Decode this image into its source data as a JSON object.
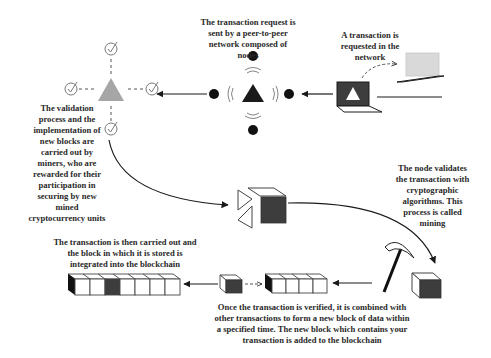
{
  "diagram": {
    "colors": {
      "background": "#ffffff",
      "ink": "#1a1a1a",
      "dark_fill": "#3d3d3d",
      "validation_gray": "#a6a6a6",
      "laptop_light": "#d9d9d9",
      "check_stroke": "#7a7a7a",
      "text": "#2a2a2a"
    },
    "steps": [
      {
        "id": "request",
        "order": 1,
        "text": "A transaction is\nrequested in the\nnetwork",
        "icon": "laptop-icon"
      },
      {
        "id": "broadcast",
        "order": 2,
        "text": "The transaction request is\nsent by a peer-to-peer\nnetwork composed of\nnodes",
        "icon": "broadcast-node-icon"
      },
      {
        "id": "validation",
        "order": 3,
        "text": "The  validation\nprocess and the\nimplementation of\nnew blocks are\ncarried out by\nminers, who are\nrewarded for their\nparticipation in\nsecuring by new\nmined\ncryptocurrency units",
        "icon": "validator-network-icon"
      },
      {
        "id": "mining",
        "order": 4,
        "text": "The  node  validates\nthe transaction with\ncryptographic\nalgorithms. This\nprocess is called\nmining",
        "icon": "pickaxe-icon"
      },
      {
        "id": "block",
        "order": 5,
        "text": "Once the transaction is verified, it is combined with\nother transactions to form a new block of data within\na specified time. The new block which contains your\ntransaction is added to the blockchain",
        "icon": "new-block-icon"
      },
      {
        "id": "blockchain",
        "order": 6,
        "text": "The transaction is then carried out and\nthe block in which it is stored is\nintegrated into the  blockchain",
        "icon": "blockchain-icon"
      }
    ],
    "nodes": {
      "broadcast_node_count": 4,
      "validator_checkmarks": 4,
      "new_block_cubes": 4,
      "blockchain_cubes": 7,
      "blockchain_highlighted_index": 2
    }
  }
}
